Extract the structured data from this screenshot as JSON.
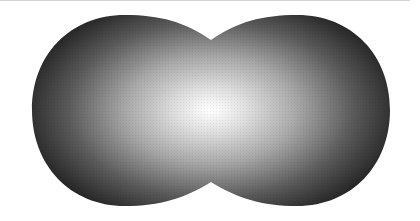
{
  "image": {
    "description": "Grayscale peanut-shaped (two overlapping lobes) blob with a radial gradient from white center to dark edges",
    "shape": "cassini-oval",
    "colors": {
      "background": "#ffffff",
      "center": "#ffffff",
      "mid": "#9a9a9a",
      "edge": "#2a2a2a",
      "top_line": "#d4d4d4"
    }
  }
}
